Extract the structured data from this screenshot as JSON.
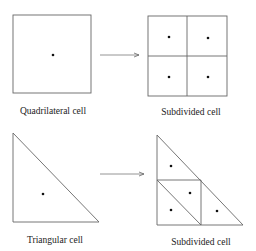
{
  "diagram": {
    "stroke_color": "#555555",
    "dot_color": "#111111",
    "top_row": {
      "left_label": "Quadrilateral cell",
      "right_label": "Subdivided cell"
    },
    "bottom_row": {
      "left_label": "Triangular cell",
      "right_label": "Subdivided cell"
    }
  }
}
